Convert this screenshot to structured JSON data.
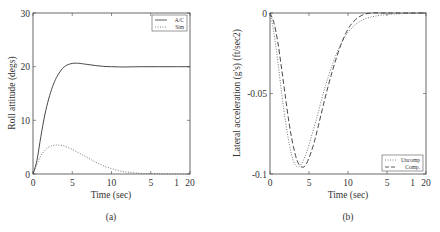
{
  "chart_data": [
    {
      "id": "a",
      "type": "line",
      "caption": "(a)",
      "title": "",
      "xlabel": "Time (sec)",
      "ylabel": "Roll attitude (degs)",
      "xlim": [
        0,
        20
      ],
      "ylim": [
        0,
        30
      ],
      "x_ticks": [
        0,
        5,
        10,
        15,
        20
      ],
      "x_tick_labels": [
        "0",
        "5",
        "10",
        "5",
        "1",
        "20"
      ],
      "y_ticks": [
        0,
        10,
        20,
        30
      ],
      "y_tick_labels": [
        "0",
        "10",
        "20",
        "30"
      ],
      "grid": false,
      "legend_position": "upper right",
      "series": [
        {
          "name": "A/C",
          "style": "solid",
          "x": [
            0,
            0.5,
            1,
            1.5,
            2,
            2.5,
            3,
            3.5,
            4,
            4.5,
            5,
            5.5,
            6,
            7,
            8,
            9,
            10,
            11,
            12,
            14,
            16,
            18,
            20
          ],
          "y": [
            0,
            2.5,
            7,
            11,
            14,
            16.3,
            18,
            19.2,
            20,
            20.4,
            20.6,
            20.65,
            20.6,
            20.4,
            20.2,
            20.05,
            20,
            19.95,
            19.95,
            20,
            20,
            20,
            20
          ]
        },
        {
          "name": "Sim",
          "style": "dotted",
          "x": [
            0,
            0.5,
            1,
            1.5,
            2,
            2.5,
            3,
            3.5,
            4,
            5,
            6,
            7,
            8,
            9,
            10,
            11,
            12,
            13,
            14,
            16,
            18,
            20
          ],
          "y": [
            0,
            1.8,
            3.4,
            4.4,
            5,
            5.3,
            5.4,
            5.35,
            5.2,
            4.6,
            3.8,
            3,
            2.2,
            1.5,
            1,
            0.6,
            0.35,
            0.2,
            0.1,
            0.03,
            0,
            0
          ]
        }
      ]
    },
    {
      "id": "b",
      "type": "line",
      "caption": "(b)",
      "title": "",
      "xlabel": "Time (sec)",
      "ylabel": "Lateral acceleration (g's) (ft/sec2)",
      "xlim": [
        0,
        20
      ],
      "ylim": [
        -0.1,
        0
      ],
      "x_ticks": [
        0,
        5,
        10,
        15,
        20
      ],
      "x_tick_labels": [
        "0",
        "5",
        "10",
        "5",
        "1",
        "20"
      ],
      "y_ticks": [
        -0.1,
        -0.05,
        0
      ],
      "y_tick_labels": [
        "-0.1",
        "-0.05",
        "0"
      ],
      "grid": false,
      "legend_position": "lower right",
      "series": [
        {
          "name": "Uncomp",
          "style": "dotted",
          "x": [
            0,
            0.5,
            1,
            1.5,
            2,
            2.5,
            3,
            3.5,
            4,
            4.5,
            5,
            6,
            7,
            8,
            9,
            10,
            11,
            12,
            13,
            14,
            15,
            16,
            18,
            20
          ],
          "y": [
            0,
            -0.012,
            -0.03,
            -0.05,
            -0.068,
            -0.082,
            -0.092,
            -0.0955,
            -0.094,
            -0.089,
            -0.082,
            -0.065,
            -0.047,
            -0.032,
            -0.02,
            -0.012,
            -0.007,
            -0.004,
            -0.0025,
            -0.0015,
            -0.001,
            -0.0006,
            -0.0002,
            0
          ]
        },
        {
          "name": "Comp.",
          "style": "dashed",
          "x": [
            0,
            0.5,
            1,
            1.5,
            2,
            2.5,
            3,
            3.5,
            4,
            4.5,
            5,
            5.5,
            6,
            7,
            8,
            9,
            10,
            11,
            12,
            13,
            14,
            15,
            16,
            18,
            20
          ],
          "y": [
            0,
            -0.006,
            -0.018,
            -0.035,
            -0.053,
            -0.07,
            -0.083,
            -0.092,
            -0.0955,
            -0.095,
            -0.09,
            -0.083,
            -0.074,
            -0.054,
            -0.036,
            -0.021,
            -0.01,
            -0.004,
            -0.001,
            0,
            0,
            0,
            0,
            0,
            0
          ]
        }
      ]
    }
  ],
  "colors": {
    "axis": "#444444",
    "line": "#333333",
    "dotted": "#666666",
    "background": "#ffffff"
  }
}
